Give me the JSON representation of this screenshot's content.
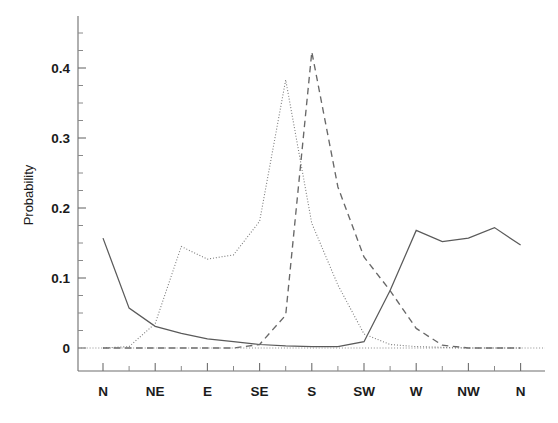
{
  "chart_data": {
    "type": "line",
    "title": "",
    "subtitle": "",
    "xlabel": "",
    "ylabel": "Probability",
    "xlim": [
      0,
      16
    ],
    "ylim": [
      0,
      0.46
    ],
    "grid": false,
    "legend": "none",
    "y_ticks": [
      0,
      0.1,
      0.2,
      0.3,
      0.4
    ],
    "y_tick_labels": [
      "0",
      "0.1",
      "0.2",
      "0.3",
      "0.4"
    ],
    "y_minor_ticks": [
      0.025,
      0.05,
      0.075,
      0.125,
      0.15,
      0.175,
      0.225,
      0.25,
      0.275,
      0.325,
      0.35,
      0.375,
      0.425,
      0.45
    ],
    "x_tick_labels": [
      "N",
      "NE",
      "E",
      "SE",
      "S",
      "SW",
      "W",
      "NW",
      "N"
    ],
    "x_tick_positions": [
      1,
      3,
      5,
      7,
      9,
      11,
      13,
      15,
      17
    ],
    "x_minor_tick_positions": [
      2,
      4,
      6,
      8,
      10,
      12,
      14,
      16
    ],
    "x_values": [
      1,
      2,
      3,
      4,
      5,
      6,
      7,
      8,
      9,
      10,
      11,
      12,
      13,
      14,
      15,
      16,
      17
    ],
    "series": [
      {
        "name": "solid-curve",
        "style": "solid",
        "color": "#5a5a5a",
        "values": [
          0.157,
          0.057,
          0.031,
          0.021,
          0.013,
          0.009,
          0.005,
          0.003,
          0.002,
          0.002,
          0.009,
          0.082,
          0.168,
          0.152,
          0.157,
          0.172,
          0.147
        ]
      },
      {
        "name": "dotted-curve",
        "style": "dotted",
        "color": "#7b7b7b",
        "values": [
          0.0,
          0.002,
          0.035,
          0.145,
          0.127,
          0.133,
          0.181,
          0.383,
          0.178,
          0.09,
          0.02,
          0.005,
          0.002,
          0.001,
          0.0,
          0.0,
          0.0
        ]
      },
      {
        "name": "dashed-curve",
        "style": "dashed",
        "color": "#686868",
        "values": [
          0.0,
          0.0,
          0.0,
          0.0,
          0.0,
          0.0,
          0.005,
          0.047,
          0.423,
          0.23,
          0.13,
          0.082,
          0.028,
          0.004,
          0.0,
          0.0,
          0.0
        ]
      },
      {
        "name": "baseline",
        "style": "dotted",
        "color": "#8d8d8d",
        "values": [
          0,
          0,
          0,
          0,
          0,
          0,
          0,
          0,
          0,
          0,
          0,
          0,
          0,
          0,
          0,
          0,
          0
        ]
      }
    ]
  }
}
